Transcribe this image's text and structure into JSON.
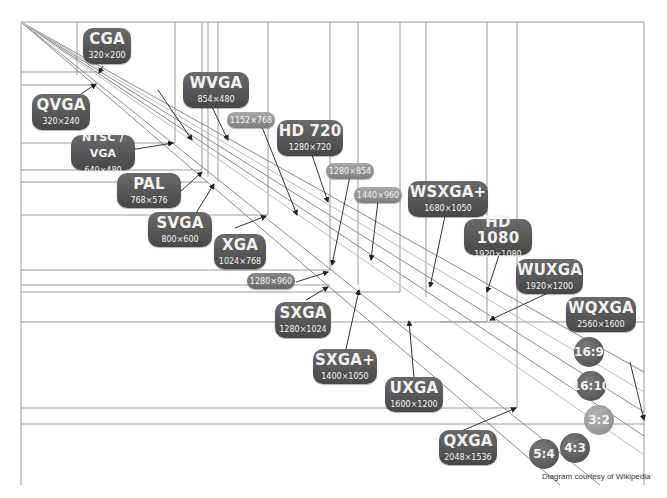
{
  "diagram": {
    "credit": "Diagram courtesy of Wikipedia",
    "standards": [
      {
        "name": "CGA",
        "resolution": "320×200"
      },
      {
        "name": "QVGA",
        "resolution": "320×240"
      },
      {
        "name": "WVGA",
        "resolution": "854×480"
      },
      {
        "name": "NTSC / VGA",
        "resolution": "640×480"
      },
      {
        "name": "PAL",
        "resolution": "768×576"
      },
      {
        "name": "SVGA",
        "resolution": "800×600"
      },
      {
        "name": "XGA",
        "resolution": "1024×768"
      },
      {
        "name": "HD 720",
        "resolution": "1280×720"
      },
      {
        "name": "WSXGA+",
        "resolution": "1680×1050"
      },
      {
        "name": "HD 1080",
        "resolution": "1920×1080"
      },
      {
        "name": "WUXGA",
        "resolution": "1920×1200"
      },
      {
        "name": "WQXGA",
        "resolution": "2560×1600"
      },
      {
        "name": "SXGA",
        "resolution": "1280×1024"
      },
      {
        "name": "SXGA+",
        "resolution": "1400×1050"
      },
      {
        "name": "UXGA",
        "resolution": "1600×1200"
      },
      {
        "name": "QXGA",
        "resolution": "2048×1536"
      }
    ],
    "unnamed_resolutions": [
      "1152×768",
      "1280×854",
      "1440×960",
      "1280×960"
    ],
    "aspect_ratios": [
      "16:9",
      "16:10",
      "3:2",
      "4:3",
      "5:4"
    ]
  }
}
